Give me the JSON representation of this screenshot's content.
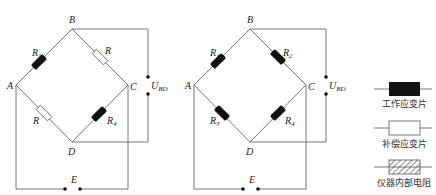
{
  "circuits": [
    {
      "id": "left",
      "nodes": {
        "A": "A",
        "B": "B",
        "C": "C",
        "D": "D",
        "E": "E"
      },
      "voltage_label": {
        "main": "U",
        "sub": "BD"
      },
      "arms": [
        {
          "arm": "AB",
          "label": "R",
          "sub": "1",
          "type": "working-gauge"
        },
        {
          "arm": "BC",
          "label": "R",
          "sub": "",
          "type": "compensation-gauge"
        },
        {
          "arm": "AD",
          "label": "R",
          "sub": "",
          "type": "compensation-gauge"
        },
        {
          "arm": "CD",
          "label": "R",
          "sub": "4",
          "type": "working-gauge"
        }
      ]
    },
    {
      "id": "right",
      "nodes": {
        "A": "A",
        "B": "B",
        "C": "C",
        "D": "D",
        "E": "E"
      },
      "voltage_label": {
        "main": "U",
        "sub": "BD"
      },
      "arms": [
        {
          "arm": "AB",
          "label": "R",
          "sub": "1",
          "type": "working-gauge"
        },
        {
          "arm": "BC",
          "label": "R",
          "sub": "2",
          "type": "working-gauge"
        },
        {
          "arm": "AD",
          "label": "R",
          "sub": "3",
          "type": "working-gauge"
        },
        {
          "arm": "CD",
          "label": "R",
          "sub": "4",
          "type": "working-gauge"
        }
      ]
    }
  ],
  "legend": [
    {
      "symbol": "filled-black-resistor",
      "label": "工作应变片"
    },
    {
      "symbol": "hollow-resistor",
      "label": "补偿应变片"
    },
    {
      "symbol": "hatched-resistor",
      "label": "仪器内部电阻"
    }
  ]
}
